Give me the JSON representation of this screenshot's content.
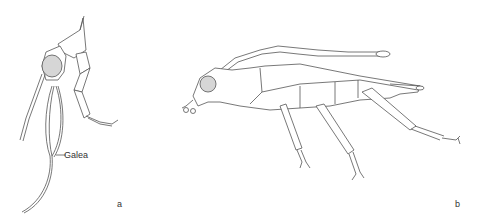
{
  "figure": {
    "panels": [
      {
        "id": "a",
        "label": "a",
        "annotation": "Galea"
      },
      {
        "id": "b",
        "label": "b"
      }
    ],
    "colors": {
      "line": "#555555",
      "eye_fill": "#d6d6d6",
      "background": "#ffffff"
    }
  }
}
